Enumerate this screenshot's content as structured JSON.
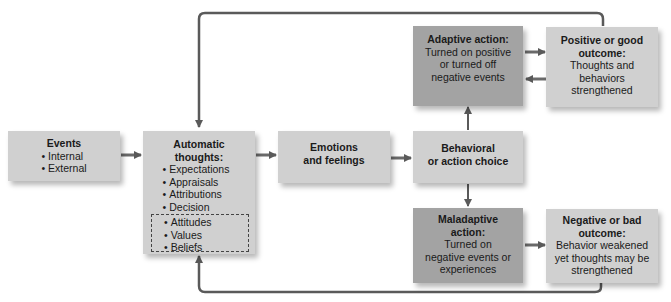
{
  "diagram": {
    "nodes": {
      "events": {
        "title": "Events",
        "items": [
          "Internal",
          "External"
        ]
      },
      "automatic_thoughts": {
        "title_line1": "Automatic",
        "title_line2": "thoughts:",
        "items": [
          "Expectations",
          "Appraisals",
          "Attributions",
          "Decision"
        ],
        "dashed_items": [
          "Attitudes",
          "Values",
          "Beliefs"
        ]
      },
      "emotions": {
        "line1": "Emotions",
        "line2": "and feelings"
      },
      "behavioral_choice": {
        "line1": "Behavioral",
        "line2": "or action choice"
      },
      "adaptive_action": {
        "title": "Adaptive action:",
        "line1": "Turned on positive",
        "line2": "or turned off",
        "line3": "negative events"
      },
      "positive_outcome": {
        "title_line1": "Positive or good",
        "title_line2": "outcome:",
        "line1": "Thoughts and",
        "line2": "behaviors",
        "line3": "strengthened"
      },
      "maladaptive_action": {
        "title_line1": "Maladaptive",
        "title_line2": "action:",
        "line1": "Turned on",
        "line2": "negative events or",
        "line3": "experiences"
      },
      "negative_outcome": {
        "title_line1": "Negative or bad",
        "title_line2": "outcome:",
        "line1": "Behavior weakened",
        "line2": "yet thoughts may be",
        "line3": "strengthened"
      }
    },
    "edges": [
      [
        "events",
        "automatic_thoughts"
      ],
      [
        "automatic_thoughts",
        "emotions"
      ],
      [
        "emotions",
        "behavioral_choice"
      ],
      [
        "behavioral_choice",
        "adaptive_action"
      ],
      [
        "behavioral_choice",
        "maladaptive_action"
      ],
      [
        "adaptive_action",
        "positive_outcome"
      ],
      [
        "positive_outcome",
        "adaptive_action"
      ],
      [
        "maladaptive_action",
        "negative_outcome"
      ],
      [
        "positive_outcome",
        "automatic_thoughts"
      ],
      [
        "negative_outcome",
        "automatic_thoughts"
      ]
    ],
    "colors": {
      "light_box": "#d0d0d0",
      "dark_box": "#a3a3a3",
      "arrow": "#5a5a5a"
    }
  }
}
